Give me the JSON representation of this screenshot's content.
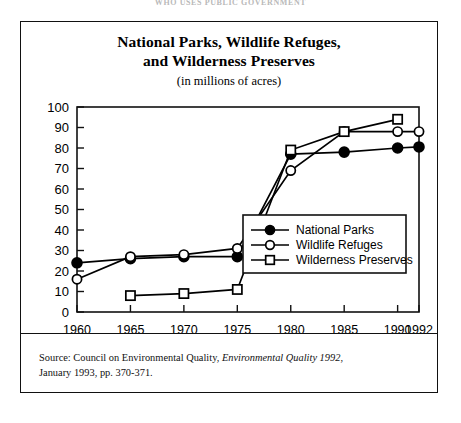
{
  "running_head": "WHO USES PUBLIC GOVERNMENT",
  "figure": {
    "title_line1": "National  Parks, Wildlife Refuges,",
    "title_line2": "and Wilderness Preserves",
    "subtitle": "(in millions of acres)"
  },
  "source": {
    "prefix": "Source: Council on Environmental Quality, ",
    "italic": "Environmental Quality 1992",
    "suffix": ",",
    "line2": "January 1993, pp. 370-371."
  },
  "legend": {
    "position": "inside-right-middle",
    "items": [
      {
        "label": "National Parks",
        "marker": "filled-circle-icon",
        "color": "#000000"
      },
      {
        "label": "Wildlife Refuges",
        "marker": "open-circle-icon",
        "color": "#000000"
      },
      {
        "label": "Wilderness Preserves",
        "marker": "open-square-icon",
        "color": "#000000"
      }
    ]
  },
  "chart_data": {
    "type": "line",
    "title": "National Parks, Wildlife Refuges, and Wilderness Preserves",
    "subtitle": "(in millions of acres)",
    "xlabel": "",
    "ylabel": "",
    "x": [
      1960,
      1965,
      1970,
      1975,
      1980,
      1985,
      1990,
      1992
    ],
    "xtick_labels": [
      "1960",
      "1965",
      "1970",
      "1975",
      "1980",
      "1985",
      "1990",
      "1992"
    ],
    "ylim": [
      0,
      100
    ],
    "yticks": [
      0,
      10,
      20,
      30,
      40,
      50,
      60,
      70,
      80,
      90,
      100
    ],
    "ytick_labels": [
      "0",
      "10",
      "20",
      "30",
      "40",
      "50",
      "60",
      "70",
      "80",
      "90",
      "100"
    ],
    "grid": false,
    "legend_position": "center right inside axes",
    "series": [
      {
        "name": "National Parks",
        "marker": "filled-circle",
        "color": "#000000",
        "values": [
          24,
          26,
          27,
          27,
          77,
          78,
          80,
          80.5
        ]
      },
      {
        "name": "Wildlife Refuges",
        "marker": "open-circle",
        "color": "#000000",
        "values": [
          16,
          27,
          28,
          31,
          69,
          88,
          88,
          88
        ]
      },
      {
        "name": "Wilderness Preserves",
        "marker": "open-square",
        "color": "#000000",
        "values": [
          null,
          8,
          9,
          11,
          79,
          88,
          94,
          null
        ]
      }
    ]
  }
}
